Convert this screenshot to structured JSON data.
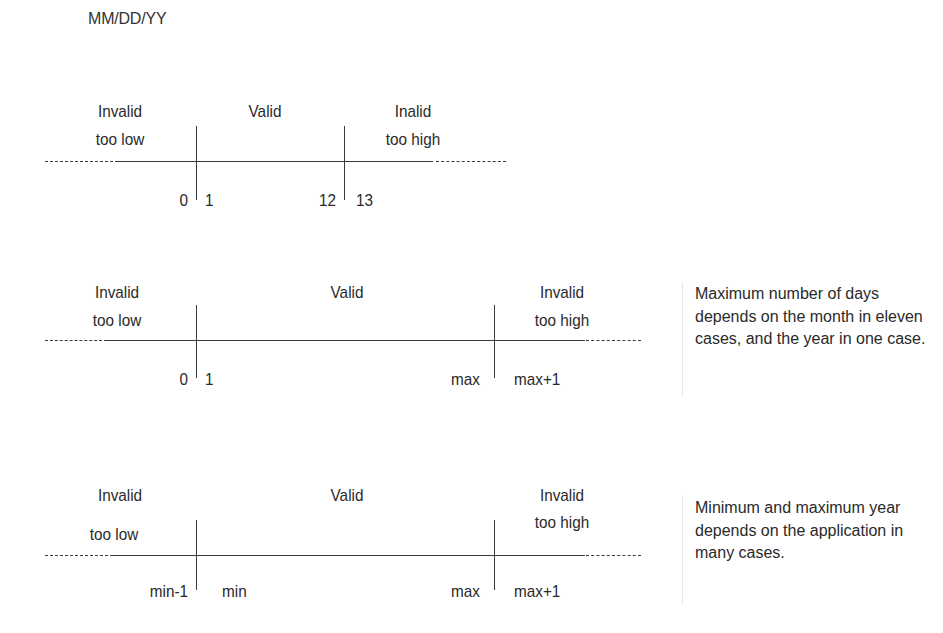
{
  "title": "MM/DD/YY",
  "diagrams": [
    {
      "field": "month",
      "regions": {
        "low": {
          "line1": "Invalid",
          "line2": "too low"
        },
        "valid": {
          "label": "Valid"
        },
        "high": {
          "line1": "Inalid",
          "line2": "too high"
        }
      },
      "boundaries": {
        "lower_outside": "0",
        "lower_inside": "1",
        "upper_inside": "12",
        "upper_outside": "13"
      }
    },
    {
      "field": "day",
      "regions": {
        "low": {
          "line1": "Invalid",
          "line2": "too low"
        },
        "valid": {
          "label": "Valid"
        },
        "high": {
          "line1": "Invalid",
          "line2": "too high"
        }
      },
      "boundaries": {
        "lower_outside": "0",
        "lower_inside": "1",
        "upper_inside": "max",
        "upper_outside": "max+1"
      },
      "note": "Maximum number of days depends on the month in eleven cases, and the year in one case."
    },
    {
      "field": "year",
      "regions": {
        "low": {
          "line1": "Invalid",
          "line2": "too low"
        },
        "valid": {
          "label": "Valid"
        },
        "high": {
          "line1": "Invalid",
          "line2": "too high"
        }
      },
      "boundaries": {
        "lower_outside": "min-1",
        "lower_inside": "min",
        "upper_inside": "max",
        "upper_outside": "max+1"
      },
      "note": "Minimum and maximum year depends on the application in many cases."
    }
  ]
}
